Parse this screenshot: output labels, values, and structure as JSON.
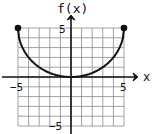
{
  "chart_data": {
    "type": "line",
    "title": "",
    "xlabel": "x",
    "ylabel": "f(x)",
    "xlim": [
      -5,
      5
    ],
    "ylim": [
      -5,
      5
    ],
    "grid": true,
    "grid_step": 1,
    "x_tick_labels": [
      "-5",
      "5"
    ],
    "y_tick_labels": [
      "5",
      "-5"
    ],
    "series": [
      {
        "name": "f(x)",
        "description": "upper-concave curve from (-5,5) to (5,5) with minimum at (0,0), closed endpoints",
        "x": [
          -5,
          -4,
          -3,
          -2,
          -1,
          0,
          1,
          2,
          3,
          4,
          5
        ],
        "y": [
          5,
          2.0,
          0.9,
          0.35,
          0.05,
          0,
          0.05,
          0.35,
          0.9,
          2.0,
          5
        ],
        "endpoints": [
          {
            "x": -5,
            "y": 5,
            "style": "closed"
          },
          {
            "x": 5,
            "y": 5,
            "style": "closed"
          }
        ]
      }
    ],
    "legend": null
  },
  "labels": {
    "x_axis": "x",
    "y_axis": "f(x)",
    "x_min": "−5",
    "x_max": "5",
    "y_max": "5",
    "y_min": "−5"
  },
  "colors": {
    "grid": "#8a8a8a",
    "axis": "#111111",
    "curve": "#111111"
  }
}
